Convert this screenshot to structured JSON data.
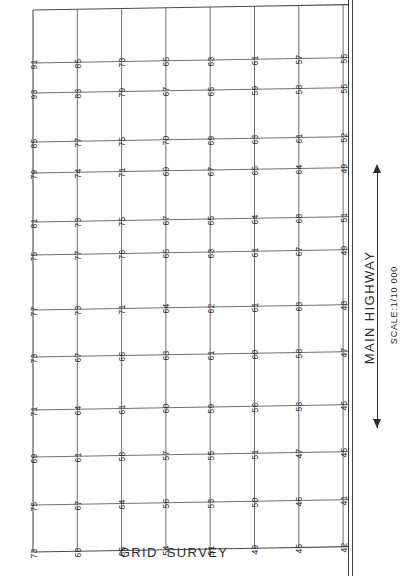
{
  "figure": {
    "bottom_caption": "GRID  SURVEY",
    "highway_label": "MAIN  HIGHWAY",
    "scale_label": "SCALE:1/10 000",
    "arrow_icon_top": "arrow-up-icon",
    "arrow_icon_bottom": "arrow-down-icon",
    "line_color": "#4a4a4a",
    "text_color": "#2b2b2b",
    "background": "#ffffff"
  },
  "chart_data": {
    "type": "heatmap",
    "title": "GRID  SURVEY",
    "xlabel": "",
    "ylabel": "",
    "grid": true,
    "legend": "none",
    "annotations": [
      "MAIN  HIGHWAY",
      "SCALE:1/10 000"
    ],
    "n_columns": 8,
    "n_rows": 12,
    "columns": [
      {
        "name": "col-1",
        "values": [
          91,
          93,
          85,
          79,
          81,
          75,
          77,
          73,
          71,
          69,
          75,
          73
        ]
      },
      {
        "name": "col-2",
        "values": [
          85,
          83,
          77,
          74,
          73,
          77,
          73,
          67,
          64,
          61,
          67,
          68
        ]
      },
      {
        "name": "col-3",
        "values": [
          73,
          79,
          75,
          71,
          75,
          76,
          71,
          66,
          61,
          58,
          64,
          65
        ]
      },
      {
        "name": "col-4",
        "values": [
          65,
          67,
          70,
          69,
          67,
          65,
          64,
          63,
          60,
          57,
          56,
          54
        ]
      },
      {
        "name": "col-5",
        "values": [
          63,
          65,
          69,
          67,
          65,
          63,
          62,
          61,
          59,
          55,
          53,
          51
        ]
      },
      {
        "name": "col-6",
        "values": [
          61,
          59,
          63,
          65,
          64,
          61,
          61,
          60,
          56,
          51,
          50,
          49
        ]
      },
      {
        "name": "col-7",
        "values": [
          57,
          58,
          61,
          64,
          68,
          67,
          63,
          58,
          53,
          47,
          46,
          45
        ]
      },
      {
        "name": "col-8",
        "values": [
          55,
          55,
          52,
          49,
          51,
          49,
          48,
          47,
          45,
          45,
          41,
          42
        ]
      }
    ],
    "rows": [
      {
        "name": "row-1",
        "values": [
          91,
          85,
          73,
          65,
          63,
          61,
          57,
          55
        ]
      },
      {
        "name": "row-2",
        "values": [
          93,
          83,
          79,
          67,
          65,
          59,
          58,
          55
        ]
      },
      {
        "name": "row-3",
        "values": [
          85,
          77,
          75,
          70,
          69,
          63,
          61,
          52
        ]
      },
      {
        "name": "row-4",
        "values": [
          79,
          74,
          71,
          69,
          67,
          65,
          64,
          49
        ]
      },
      {
        "name": "row-5",
        "values": [
          81,
          73,
          75,
          67,
          65,
          64,
          68,
          51
        ]
      },
      {
        "name": "row-6",
        "values": [
          75,
          77,
          76,
          65,
          63,
          61,
          67,
          49
        ]
      },
      {
        "name": "row-7",
        "values": [
          77,
          73,
          71,
          64,
          62,
          61,
          63,
          48
        ]
      },
      {
        "name": "row-8",
        "values": [
          73,
          67,
          66,
          63,
          61,
          60,
          58,
          47
        ]
      },
      {
        "name": "row-9",
        "values": [
          71,
          64,
          61,
          60,
          59,
          56,
          53,
          45
        ]
      },
      {
        "name": "row-10",
        "values": [
          69,
          61,
          58,
          57,
          55,
          51,
          47,
          45
        ]
      },
      {
        "name": "row-11",
        "values": [
          75,
          67,
          64,
          56,
          53,
          50,
          46,
          41
        ]
      },
      {
        "name": "row-12",
        "values": [
          73,
          68,
          65,
          54,
          51,
          49,
          45,
          42
        ]
      }
    ]
  }
}
